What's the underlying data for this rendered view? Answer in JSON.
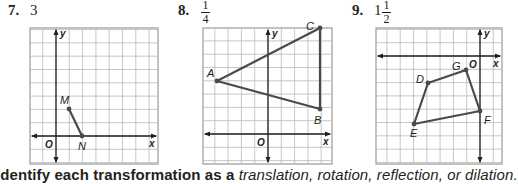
{
  "problems": [
    {
      "number": "7.",
      "answer": "3",
      "grid": {
        "left": 30,
        "top": 28,
        "right": 158,
        "bottom": 164,
        "cell": 13.3,
        "yaxis_x": 56,
        "xaxis_y": 136
      },
      "points": [
        {
          "label": "M",
          "x": 69,
          "y": 109,
          "lx": 60,
          "ly": 104
        },
        {
          "label": "N",
          "x": 82,
          "y": 136,
          "lx": 78,
          "ly": 150
        }
      ],
      "polyline": "69,109 82,136",
      "closed": false,
      "origin_label": "O",
      "x_label": "x",
      "y_label": "y"
    },
    {
      "number": "8.",
      "answer_fraction": {
        "numerator": "1",
        "denominator": "4"
      },
      "grid": {
        "left": 203,
        "top": 28,
        "right": 332,
        "bottom": 164,
        "cell": 13.3,
        "yaxis_x": 268,
        "xaxis_y": 134
      },
      "points": [
        {
          "label": "A",
          "x": 217,
          "y": 81,
          "lx": 207,
          "ly": 77
        },
        {
          "label": "C",
          "x": 320,
          "y": 28,
          "lx": 306,
          "ly": 30
        },
        {
          "label": "B",
          "x": 320,
          "y": 109,
          "lx": 314,
          "ly": 124
        }
      ],
      "polyline": "217,81 320,28 320,109",
      "closed": true,
      "origin_label": "O",
      "x_label": "x",
      "y_label": "y"
    },
    {
      "number": "9.",
      "answer_mixed": {
        "whole": "1",
        "numerator": "1",
        "denominator": "2"
      },
      "grid": {
        "left": 376,
        "top": 28,
        "right": 502,
        "bottom": 164,
        "cell": 13.3,
        "yaxis_x": 480,
        "xaxis_y": 56
      },
      "points": [
        {
          "label": "D",
          "x": 428,
          "y": 83,
          "lx": 416,
          "ly": 83
        },
        {
          "label": "G",
          "x": 466,
          "y": 70,
          "lx": 452,
          "ly": 70
        },
        {
          "label": "F",
          "x": 480,
          "y": 111,
          "lx": 484,
          "ly": 124
        },
        {
          "label": "E",
          "x": 414,
          "y": 124,
          "lx": 410,
          "ly": 137
        }
      ],
      "polyline": "428,83 466,70 480,111 414,124",
      "closed": true,
      "origin_label": "O",
      "x_label": "x",
      "y_label": "y"
    }
  ],
  "instruction": {
    "lead": "Identify each transformation as a ",
    "terms": "translation, rotation, reflection, or dilation."
  },
  "colors": {
    "grid": "#b9b9b9",
    "axis": "#231f20",
    "figure": "#4a4a4a",
    "border": "#9a9a9a"
  }
}
